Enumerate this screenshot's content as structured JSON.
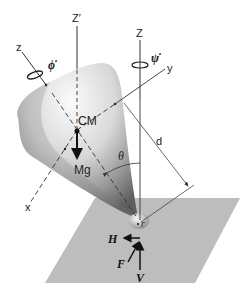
{
  "diagram": {
    "axes": {
      "z_prime": "Z′",
      "z_fixed": "Z",
      "z_body": "z",
      "y_body": "y",
      "x_body": "x"
    },
    "rotations": {
      "phi_dot": "ϕ̇",
      "psi_dot": "ψ̇"
    },
    "points": {
      "center_of_mass": "CM",
      "contact_point": "r"
    },
    "forces": {
      "weight": "Mg",
      "horizontal": "H",
      "friction": "F",
      "vertical": "V"
    },
    "dimensions": {
      "tilt_angle": "θ",
      "distance": "d"
    },
    "colors": {
      "plane": "#b9b9b9",
      "top_light": "#f4f4f4",
      "top_dark": "#6e6e6e",
      "lines": "#333333"
    }
  }
}
